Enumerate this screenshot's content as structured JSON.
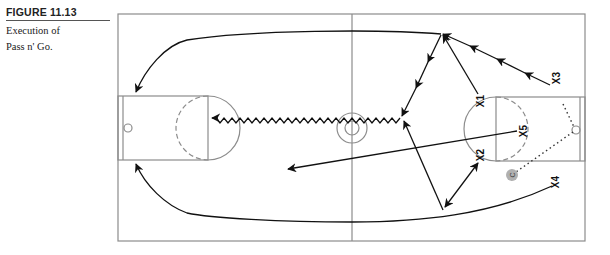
{
  "figure": {
    "label": "FIGURE 11.13",
    "title_line1": "Execution of",
    "title_line2": "Pass n' Go."
  },
  "diagram": {
    "type": "basketball-court-play",
    "play_name": "Pass n' Go",
    "court": {
      "line_color": "#8c8c8c",
      "bounds": {
        "left": 118,
        "top": 14,
        "right": 585,
        "bottom": 241
      },
      "midcourt_x": 352,
      "center_circle": {
        "cx": 352,
        "cy": 128,
        "r_outer": 15,
        "r_inner": 7
      }
    },
    "players": [
      {
        "id": "x1",
        "label": "X1",
        "x": 481,
        "y": 101
      },
      {
        "id": "x2",
        "label": "X2",
        "x": 481,
        "y": 155
      },
      {
        "id": "x3",
        "label": "X3",
        "x": 557,
        "y": 78
      },
      {
        "id": "x4",
        "label": "X4",
        "x": 556,
        "y": 182
      },
      {
        "id": "x5",
        "label": "X5",
        "x": 524,
        "y": 131
      }
    ],
    "coach": {
      "label": "C",
      "x": 512,
      "y": 175,
      "fill": "#b0b0b0"
    },
    "movements": [
      {
        "kind": "pass-chain",
        "from": "X3",
        "to": "top-wing",
        "note": "passing arrows from X3 up to wing"
      },
      {
        "kind": "cut",
        "from": "X1",
        "to": "top-wing"
      },
      {
        "kind": "pass",
        "from": "top-wing",
        "to": "midcourt-right"
      },
      {
        "kind": "dribble",
        "from": "midcourt-right",
        "to": "left-free-throw-line"
      },
      {
        "kind": "run",
        "from": "top-wing",
        "to": "left-lane-top"
      },
      {
        "kind": "run",
        "from": "X4",
        "to": "left-lane-bottom"
      },
      {
        "kind": "cut",
        "from": "bottom-wing",
        "to": "midcourt-right"
      },
      {
        "kind": "pass",
        "from": "X2",
        "to": "bottom-wing"
      },
      {
        "kind": "run",
        "from": "X5",
        "to": "left-backcourt"
      },
      {
        "kind": "dotted-path",
        "from": "top-lane-right",
        "to": "coach",
        "via": "rim"
      }
    ]
  }
}
